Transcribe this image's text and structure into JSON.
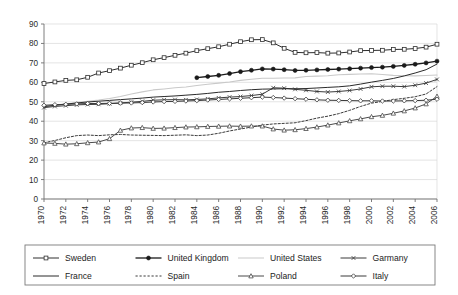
{
  "chart_data": {
    "type": "line",
    "title": "",
    "subtitle": "",
    "xlabel": "",
    "ylabel": "",
    "xlim": [
      1970,
      2006
    ],
    "ylim": [
      0,
      90
    ],
    "ytick_step": 10,
    "xtick_step": 2,
    "grid": true,
    "legend_position": "bottom",
    "yticks": [
      0,
      10,
      20,
      30,
      40,
      50,
      60,
      70,
      80,
      90
    ],
    "xticks": [
      1970,
      1972,
      1974,
      1976,
      1978,
      1980,
      1982,
      1984,
      1986,
      1988,
      1990,
      1992,
      1994,
      1996,
      1998,
      2000,
      2002,
      2004,
      2006
    ],
    "x": [
      1970,
      1971,
      1972,
      1973,
      1974,
      1975,
      1976,
      1977,
      1978,
      1979,
      1980,
      1981,
      1982,
      1983,
      1984,
      1985,
      1986,
      1987,
      1988,
      1989,
      1990,
      1991,
      1992,
      1993,
      1994,
      1995,
      1996,
      1997,
      1998,
      1999,
      2000,
      2001,
      2002,
      2003,
      2004,
      2005,
      2006
    ],
    "series": [
      {
        "name": "Sweden",
        "marker": "open-square",
        "dash": "solid",
        "color": "#2e2e2e",
        "width": 1.0,
        "values": [
          59.4,
          60.2,
          61.0,
          61.3,
          62.6,
          64.8,
          66.0,
          67.3,
          68.8,
          70.1,
          71.6,
          72.7,
          73.9,
          75.0,
          76.3,
          77.3,
          78.3,
          79.6,
          80.9,
          81.9,
          82.0,
          80.3,
          77.5,
          75.4,
          75.2,
          75.3,
          75.0,
          75.1,
          75.6,
          76.3,
          76.4,
          76.5,
          76.9,
          77.0,
          77.4,
          78.1,
          79.6
        ]
      },
      {
        "name": "United Kingdom",
        "marker": "filled-circle",
        "dash": "solid",
        "color": "#1a1a1a",
        "width": 1.3,
        "start_year": 1984,
        "values": [
          null,
          null,
          null,
          null,
          null,
          null,
          null,
          null,
          null,
          null,
          null,
          null,
          null,
          null,
          62.4,
          63.0,
          63.6,
          64.5,
          65.5,
          66.2,
          66.9,
          66.8,
          66.5,
          66.1,
          66.2,
          66.4,
          66.6,
          66.8,
          67.0,
          67.3,
          67.6,
          67.8,
          68.2,
          68.7,
          69.3,
          70.0,
          70.9
        ]
      },
      {
        "name": "United States",
        "marker": "none",
        "dash": "solid",
        "color": "#c9c9c9",
        "width": 1.1,
        "values": [
          47.6,
          48.2,
          48.8,
          49.6,
          50.3,
          50.9,
          51.7,
          52.7,
          54.0,
          55.1,
          56.1,
          56.6,
          57.2,
          57.6,
          58.4,
          59.0,
          59.6,
          60.2,
          61.0,
          61.6,
          62.1,
          62.1,
          62.2,
          62.3,
          63.0,
          63.2,
          63.4,
          63.9,
          64.1,
          64.3,
          64.4,
          64.0,
          63.6,
          63.4,
          63.3,
          63.5,
          63.8
        ]
      },
      {
        "name": "Garmany",
        "marker": "x",
        "dash": "solid",
        "color": "#3a3a3a",
        "width": 1.0,
        "values": [
          47.0,
          47.6,
          48.0,
          48.4,
          48.6,
          48.7,
          49.0,
          49.4,
          49.8,
          50.2,
          50.8,
          51.0,
          51.1,
          51.0,
          51.2,
          51.5,
          52.0,
          52.4,
          52.7,
          53.2,
          53.9,
          57.2,
          57.0,
          56.4,
          55.9,
          55.3,
          55.0,
          55.3,
          55.8,
          56.6,
          57.7,
          58.0,
          58.0,
          57.8,
          58.5,
          59.6,
          61.5
        ]
      },
      {
        "name": "France",
        "marker": "none",
        "dash": "solid",
        "color": "#2a2a2a",
        "width": 1.0,
        "values": [
          47.5,
          48.2,
          48.8,
          49.4,
          49.9,
          50.3,
          50.7,
          51.1,
          51.5,
          51.9,
          52.4,
          52.7,
          53.0,
          53.4,
          53.8,
          54.3,
          54.9,
          55.3,
          55.8,
          56.2,
          56.5,
          56.6,
          56.7,
          56.7,
          56.8,
          57.1,
          57.4,
          57.7,
          58.2,
          59.1,
          60.1,
          61.0,
          62.0,
          63.3,
          64.8,
          66.5,
          69.4
        ]
      },
      {
        "name": "Spain",
        "marker": "none",
        "dash": "dotted",
        "color": "#3a3a3a",
        "width": 1.0,
        "values": [
          28.9,
          30.1,
          31.5,
          32.6,
          32.9,
          32.6,
          33.0,
          33.2,
          32.9,
          32.8,
          32.7,
          32.6,
          32.8,
          33.0,
          32.6,
          32.9,
          33.8,
          35.0,
          36.0,
          37.0,
          38.0,
          38.6,
          38.9,
          39.2,
          40.3,
          41.6,
          42.6,
          43.9,
          45.6,
          47.6,
          49.3,
          50.2,
          51.1,
          51.8,
          52.6,
          54.0,
          57.8
        ]
      },
      {
        "name": "Poland",
        "marker": "open-triangle",
        "dash": "solid",
        "color": "#4a4a4a",
        "width": 1.0,
        "values": [
          28.8,
          28.6,
          28.2,
          28.4,
          28.9,
          29.3,
          31.0,
          35.3,
          36.5,
          36.7,
          36.3,
          36.4,
          36.7,
          37.0,
          37.1,
          37.3,
          37.4,
          37.5,
          37.4,
          37.5,
          37.5,
          36.0,
          35.4,
          35.6,
          36.2,
          37.0,
          38.0,
          39.1,
          40.2,
          41.2,
          42.3,
          43.0,
          44.1,
          45.3,
          46.8,
          48.9,
          52.8
        ]
      },
      {
        "name": "Italy",
        "marker": "open-diamond",
        "dash": "solid",
        "color": "#3a3a3a",
        "width": 1.0,
        "values": [
          48.2,
          48.5,
          48.7,
          48.9,
          49.1,
          49.1,
          49.2,
          49.3,
          49.4,
          49.6,
          49.9,
          50.1,
          50.2,
          50.4,
          50.6,
          50.9,
          51.2,
          51.5,
          51.8,
          52.1,
          52.4,
          52.2,
          51.9,
          51.6,
          51.3,
          51.0,
          50.8,
          50.7,
          50.6,
          50.5,
          50.5,
          50.4,
          50.4,
          50.5,
          50.6,
          50.8,
          51.3
        ]
      }
    ]
  },
  "legend": {
    "entries": [
      {
        "label": "Sweden",
        "marker": "open-square",
        "dash": "solid",
        "color": "#2e2e2e"
      },
      {
        "label": "United Kingdom",
        "marker": "filled-circle",
        "dash": "solid",
        "color": "#1a1a1a"
      },
      {
        "label": "United States",
        "marker": "none",
        "dash": "solid",
        "color": "#c9c9c9"
      },
      {
        "label": "Garmany",
        "marker": "x",
        "dash": "solid",
        "color": "#3a3a3a"
      },
      {
        "label": "France",
        "marker": "none",
        "dash": "solid",
        "color": "#2a2a2a"
      },
      {
        "label": "Spain",
        "marker": "none",
        "dash": "dotted",
        "color": "#3a3a3a"
      },
      {
        "label": "Poland",
        "marker": "open-triangle",
        "dash": "solid",
        "color": "#4a4a4a"
      },
      {
        "label": "Italy",
        "marker": "open-diamond",
        "dash": "solid",
        "color": "#3a3a3a"
      }
    ]
  },
  "plot_geometry": {
    "left": 44,
    "right": 437,
    "top": 24,
    "bottom": 199
  }
}
